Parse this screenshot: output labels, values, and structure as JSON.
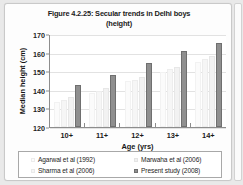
{
  "chart_data": {
    "type": "bar",
    "title": "Figure 4.2.25: Secular trends in Delhi boys (height)",
    "title_line1": "Figure 4.2.25: Secular trends in Delhi boys",
    "title_line2": "(height)",
    "xlabel": "Age (yrs)",
    "ylabel": "Median height (cm)",
    "categories": [
      "10+",
      "11+",
      "12+",
      "13+",
      "14+"
    ],
    "ylim": [
      120,
      170
    ],
    "yticks": [
      120,
      130,
      140,
      150,
      160,
      170
    ],
    "grid": true,
    "legend_position": "bottom",
    "series": [
      {
        "name": "Agarwal et al (1992)",
        "color": "#fcfcfc",
        "values": [
          133.5,
          138.5,
          144.5,
          149.5,
          155.0
        ]
      },
      {
        "name": "Sharma et al (2006)",
        "color": "#f6f6f6",
        "values": [
          134.5,
          139.5,
          145.5,
          151.0,
          156.5
        ]
      },
      {
        "name": "Marwaha et al (2006)",
        "color": "#f1f1f1",
        "values": [
          136.0,
          141.0,
          147.0,
          152.5,
          158.0
        ]
      },
      {
        "name": "Present study (2008)",
        "color": "#8f8f8f",
        "values": [
          142.8,
          147.8,
          154.5,
          160.8,
          165.2
        ]
      }
    ]
  },
  "legend": {
    "entries": [
      {
        "label": "Agarwal et al (1992)",
        "series": 0
      },
      {
        "label": "Marwaha et al (2006)",
        "series": 2
      },
      {
        "label": "Sharma et al (2006)",
        "series": 1
      },
      {
        "label": "Present study (2008)",
        "series": 3
      }
    ]
  }
}
